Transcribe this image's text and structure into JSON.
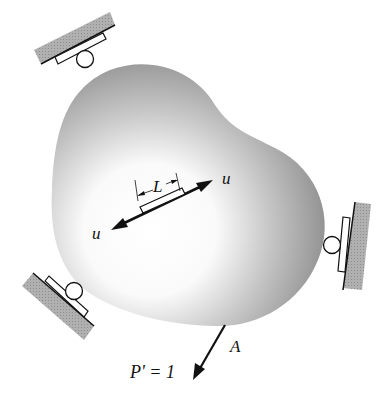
{
  "figure": {
    "labels": {
      "element_length": "L",
      "displacement_top": "u",
      "displacement_bottom": "u",
      "point": "A",
      "load": "P' = 1"
    },
    "supports": [
      {
        "name": "top-left roller",
        "type": "roller"
      },
      {
        "name": "bottom-left roller",
        "type": "roller"
      },
      {
        "name": "right roller",
        "type": "roller"
      }
    ],
    "colors": {
      "body_edge": "#8c8c8c",
      "body_center": "#ffffff",
      "ground_fill": "#a8a8a8",
      "line": "#111111"
    }
  }
}
